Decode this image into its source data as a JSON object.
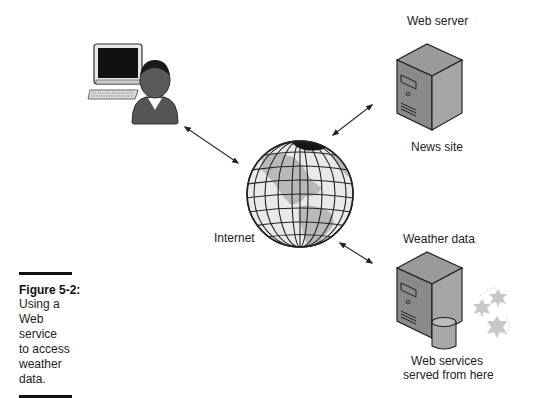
{
  "figure": {
    "number": "Figure 5-2:",
    "caption_lines": [
      "Using a",
      "Web service",
      "to access",
      "weather",
      "data."
    ]
  },
  "nodes": {
    "user": {
      "icon": "user-computer-icon"
    },
    "internet": {
      "label": "Internet",
      "icon": "globe-icon"
    },
    "web_server": {
      "label_top": "Web server",
      "label_bottom": "News site",
      "icon": "server-icon"
    },
    "weather_server": {
      "label_top": "Weather data",
      "label_bottom_1": "Web services",
      "label_bottom_2": "served from here",
      "icon": "server-database-icon"
    }
  },
  "edges": [
    {
      "from": "user",
      "to": "internet",
      "type": "bidirectional"
    },
    {
      "from": "internet",
      "to": "web_server",
      "type": "bidirectional"
    },
    {
      "from": "internet",
      "to": "weather_server",
      "type": "bidirectional"
    }
  ]
}
